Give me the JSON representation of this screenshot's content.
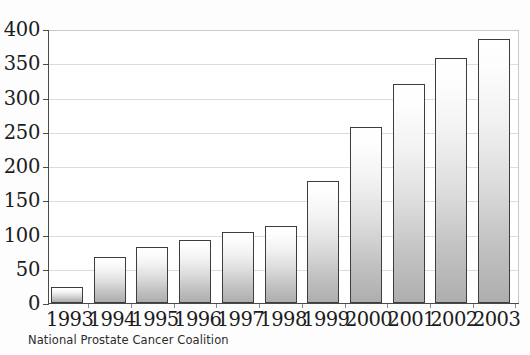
{
  "chart_data": {
    "type": "bar",
    "title": "",
    "subtitle": "",
    "xlabel": "",
    "ylabel": "",
    "categories": [
      "1993",
      "1994",
      "1995",
      "1996",
      "1997",
      "1998",
      "1999",
      "2000",
      "2001",
      "2002",
      "2003"
    ],
    "values": [
      23,
      67,
      82,
      92,
      104,
      113,
      178,
      257,
      320,
      358,
      385
    ],
    "series": [
      {
        "name": "",
        "values": [
          23,
          67,
          82,
          92,
          104,
          113,
          178,
          257,
          320,
          358,
          385
        ]
      }
    ],
    "ylim": [
      0,
      400
    ],
    "ytick_values": [
      0,
      50,
      100,
      150,
      200,
      250,
      300,
      350,
      400
    ],
    "ytick_labels": [
      "0",
      "50",
      "100",
      "150",
      "200",
      "250",
      "300",
      "350",
      "400"
    ],
    "grid": true,
    "grid_axis": "y",
    "legend": false,
    "legend_position": "none",
    "annotations": [],
    "source_note": "National Prostate Cancer Coalition",
    "colors": {
      "bar_fill_top": "#ffffff",
      "bar_fill_bottom": "#aeaeae",
      "bar_outline": "#3d3d3d",
      "gridline": "#dcdcdc",
      "axis": "#4a4a4a",
      "text": "#1c1c1c",
      "background": "#fdfdfd"
    }
  }
}
